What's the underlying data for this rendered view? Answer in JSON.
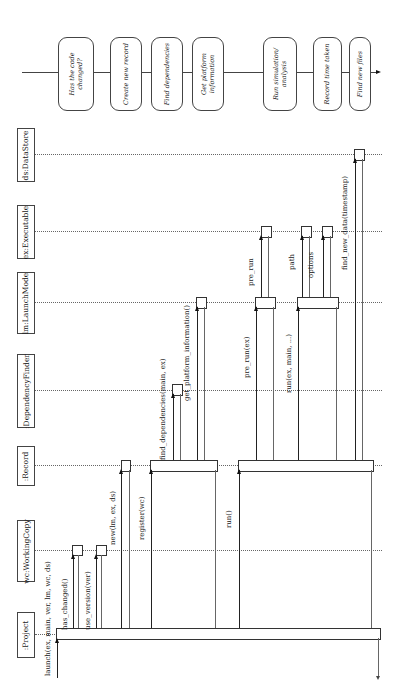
{
  "diagram": {
    "type": "sequence",
    "orientation": "rotated-90",
    "participants": [
      {
        "id": "project",
        "label": ":Project"
      },
      {
        "id": "wc",
        "label": "wc:WorkingCopy"
      },
      {
        "id": "record",
        "label": ":Record"
      },
      {
        "id": "depfinder",
        "label": ":DependencyFinder"
      },
      {
        "id": "lm",
        "label": "lm:LaunchMode"
      },
      {
        "id": "ex",
        "label": "ex:Executable"
      },
      {
        "id": "ds",
        "label": "ds:DataStore"
      }
    ],
    "messages": [
      {
        "from": "external",
        "to": "project",
        "label": "launch(ex, main, ver, lm, wc, ds)"
      },
      {
        "from": "project",
        "to": "wc",
        "label": "has_changed()"
      },
      {
        "from": "project",
        "to": "wc",
        "label": "use_version(ver)"
      },
      {
        "from": "project",
        "to": "record",
        "label": "new(lm, ex, ds)"
      },
      {
        "from": "project",
        "to": "record",
        "label": "register(wc)"
      },
      {
        "from": "record",
        "to": "depfinder",
        "label": "find_dependencies(main, ex)"
      },
      {
        "from": "record",
        "to": "lm",
        "label": "get_platform_information()"
      },
      {
        "from": "project",
        "to": "record",
        "label": "run()"
      },
      {
        "from": "record",
        "to": "lm",
        "label": "pre_run(ex)"
      },
      {
        "from": "lm",
        "to": "ex",
        "label": "pre_run"
      },
      {
        "from": "record",
        "to": "lm",
        "label": "run(ex, main, ...)"
      },
      {
        "from": "lm",
        "to": "ex",
        "label": "path"
      },
      {
        "from": "lm",
        "to": "ex",
        "label": "options"
      },
      {
        "from": "record",
        "to": "ds",
        "label": "find_new_data(timestamp)"
      }
    ],
    "steps": [
      {
        "label": "Has the code\nchanged?"
      },
      {
        "label": "Create new record"
      },
      {
        "label": "Find dependencies"
      },
      {
        "label": "Get platform\ninformation"
      },
      {
        "label": "Run simulation/\nanalysis"
      },
      {
        "label": "Record time taken"
      },
      {
        "label": "Find new files"
      }
    ]
  }
}
